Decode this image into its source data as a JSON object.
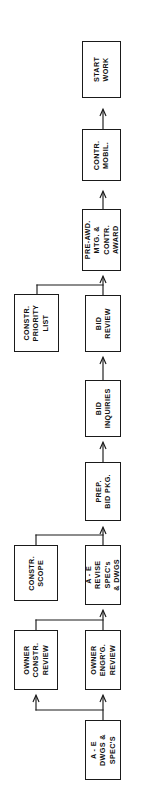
{
  "diagram": {
    "orientation": "rotated-90-ccw",
    "line_color": "#1a1a1a",
    "box_fill": "#ffffff",
    "nodes": [
      {
        "id": "start-work",
        "label": "START WORK",
        "lines": [
          "START",
          "WORK"
        ],
        "x": 82,
        "y": 41,
        "w": 39,
        "h": 57
      },
      {
        "id": "contr-mobil",
        "label": "CONTR. MOBIL.",
        "lines": [
          "CONTR.",
          "MOBIL."
        ],
        "x": 82,
        "y": 129,
        "w": 39,
        "h": 52
      },
      {
        "id": "pre-awd-mtg-contr-award",
        "label": "PRE-AWD. MTG. & CONTR. AWARD",
        "lines": [
          "PRE-AWD.",
          "MTG. &",
          "CONTR.",
          "AWARD"
        ],
        "x": 82,
        "y": 209,
        "w": 39,
        "h": 62
      },
      {
        "id": "bid-review",
        "label": "BID REVIEW",
        "lines": [
          "BID",
          "REVIEW"
        ],
        "x": 85,
        "y": 295,
        "w": 36,
        "h": 57
      },
      {
        "id": "constr-priority-list",
        "label": "CONSTR. PRIORITY LIST",
        "lines": [
          "CONSTR.",
          "PRIORITY",
          "LIST"
        ],
        "x": 14,
        "y": 294,
        "w": 45,
        "h": 58
      },
      {
        "id": "bid-inquiries",
        "label": "BID INQUIRIES",
        "lines": [
          "BID",
          "INQUIRIES"
        ],
        "x": 85,
        "y": 380,
        "w": 36,
        "h": 57
      },
      {
        "id": "prep-bid-pkg",
        "label": "PREP. BID PKG.",
        "lines": [
          "PREP.",
          "BID  PKG."
        ],
        "x": 85,
        "y": 462,
        "w": 36,
        "h": 59
      },
      {
        "id": "ae-revise-specs-dwgs",
        "label": "A - E REVISE SPEC's & DWGS",
        "lines": [
          "A - E",
          "REVISE",
          "SPEC's",
          "& DWGS"
        ],
        "x": 85,
        "y": 545,
        "w": 36,
        "h": 60
      },
      {
        "id": "constr-scope",
        "label": "CONSTR. SCOPE",
        "lines": [
          "CONSTR.",
          "SCOPE"
        ],
        "x": 14,
        "y": 545,
        "w": 44,
        "h": 56
      },
      {
        "id": "owner-constr-review",
        "label": "OWNER CONSTR. REVIEW",
        "lines": [
          "OWNER",
          "CONSTR.",
          "REVIEW"
        ],
        "x": 14,
        "y": 630,
        "w": 44,
        "h": 60
      },
      {
        "id": "owner-engrg-review",
        "label": "OWNER ENGR'G. REVIEW",
        "lines": [
          "OWNER",
          "ENGR'G.",
          "REVIEW"
        ],
        "x": 85,
        "y": 630,
        "w": 36,
        "h": 60
      },
      {
        "id": "ae-dwgs-specs",
        "label": "A - E DWGS & SPEC'S",
        "lines": [
          "A - E",
          "DWGS &",
          "SPEC'S"
        ],
        "x": 85,
        "y": 720,
        "w": 36,
        "h": 60
      }
    ],
    "connectors": [
      {
        "id": "ae-dwgs-to-owner-engrg",
        "from": "ae-dwgs-specs",
        "to": "owner-engrg-review",
        "arrow": true
      },
      {
        "id": "ae-dwgs-to-owner-constr",
        "from": "ae-dwgs-specs",
        "to": "owner-constr-review",
        "arrow": true
      },
      {
        "id": "owner-engrg-to-ae-revise",
        "from": "owner-engrg-review",
        "to": "ae-revise-specs-dwgs",
        "arrow": true
      },
      {
        "id": "owner-constr-to-ae-revise",
        "from": "owner-constr-review",
        "to": "ae-revise-specs-dwgs",
        "arrow": false
      },
      {
        "id": "ae-revise-to-prep-bid",
        "from": "ae-revise-specs-dwgs",
        "to": "prep-bid-pkg",
        "arrow": true
      },
      {
        "id": "constr-scope-to-prep-bid",
        "from": "constr-scope",
        "to": "prep-bid-pkg",
        "arrow": false
      },
      {
        "id": "prep-bid-to-bid-inquiries",
        "from": "prep-bid-pkg",
        "to": "bid-inquiries",
        "arrow": true
      },
      {
        "id": "bid-inquiries-to-bid-review",
        "from": "bid-inquiries",
        "to": "bid-review",
        "arrow": true
      },
      {
        "id": "bid-review-to-pre-awd",
        "from": "bid-review",
        "to": "pre-awd-mtg-contr-award",
        "arrow": true
      },
      {
        "id": "constr-priority-to-pre-awd",
        "from": "constr-priority-list",
        "to": "pre-awd-mtg-contr-award",
        "arrow": false
      },
      {
        "id": "pre-awd-to-contr-mobil",
        "from": "pre-awd-mtg-contr-award",
        "to": "contr-mobil",
        "arrow": true
      },
      {
        "id": "contr-mobil-to-start-work",
        "from": "contr-mobil",
        "to": "start-work",
        "arrow": true
      }
    ]
  }
}
